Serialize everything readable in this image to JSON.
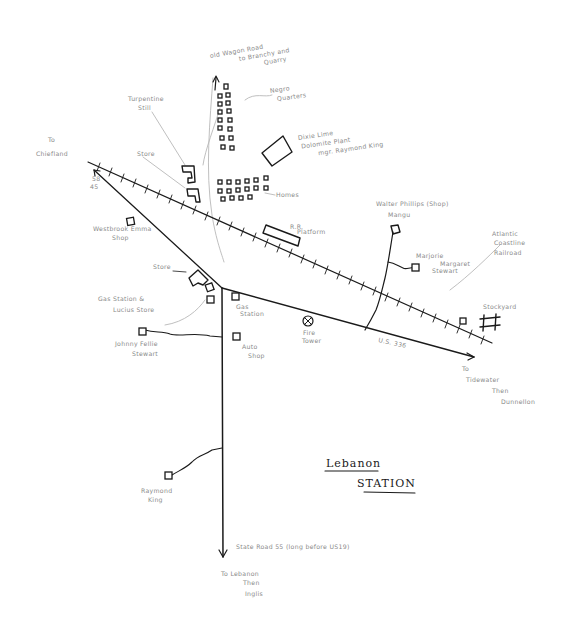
{
  "map": {
    "title_line1": "Lebanon",
    "title_line2": "STATION",
    "labels": {
      "old_wagon_road": [
        "old Wagon Road",
        "to Branchy and",
        "Quarry"
      ],
      "negro_quarters": [
        "Negro",
        "Quarters"
      ],
      "turpentine_still": [
        "Turpentine",
        "Still"
      ],
      "store_top": "Store",
      "dixie_lime": [
        "Dixie Lime",
        "Dolomite Plant",
        "mgr. Raymond King"
      ],
      "homes": "Homes",
      "to_chiefland": [
        "To",
        "Chiefland"
      ],
      "road_58": [
        "58",
        "45"
      ],
      "rr_platform": [
        "R.R.",
        "Platform"
      ],
      "walter_phillips": "Walter Phillips (Shop)",
      "mangu": "Mangu",
      "marjorie": "Marjorie",
      "margaret_stewart": [
        "Margaret",
        "Stewart"
      ],
      "atlantic_coastline": [
        "Atlantic",
        "Coastline",
        "Railroad"
      ],
      "westbrook_emma": [
        "Westbrook Emma",
        "Shop"
      ],
      "store_mid": "Store",
      "gas_station_lucius": [
        "Gas Station &",
        "Lucius Store"
      ],
      "gas_station": [
        "Gas",
        "Station"
      ],
      "johnny_fellie_stewart": [
        "Johnny Fellie",
        "Stewart"
      ],
      "auto_shop": [
        "Auto",
        "Shop"
      ],
      "fire_tower": [
        "Fire",
        "Tower"
      ],
      "us_336": "U.S. 336",
      "stockyard": "Stockyard",
      "to_tidewater": [
        "To",
        "Tidewater",
        "Then",
        "Dunnellon"
      ],
      "raymond_king": [
        "Raymond",
        "King"
      ],
      "state_road_55": "State Road 55 (long before US19)",
      "to_lebanon": [
        "To Lebanon",
        "Then",
        "Inglis"
      ],
      "us_vertical": "U.S. 19"
    }
  }
}
